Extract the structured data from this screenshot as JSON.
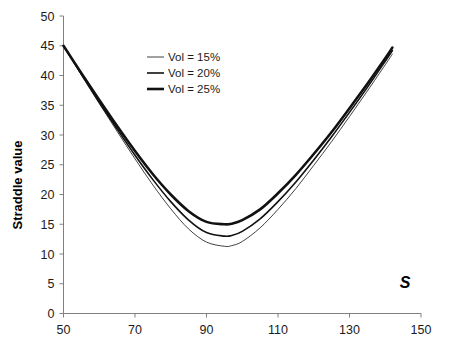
{
  "chart_data": {
    "type": "line",
    "title": "",
    "xlabel": "S",
    "ylabel": "Straddle value",
    "xlim": [
      50,
      150
    ],
    "ylim": [
      0,
      50
    ],
    "xticks": [
      50,
      70,
      90,
      110,
      130,
      150
    ],
    "yticks": [
      0,
      5,
      10,
      15,
      20,
      25,
      30,
      35,
      40,
      45,
      50
    ],
    "grid": false,
    "legend_position": "upper-left-inside",
    "x": [
      50,
      55,
      60,
      65,
      70,
      75,
      80,
      85,
      90,
      95,
      97,
      100,
      105,
      110,
      115,
      120,
      125,
      130,
      135,
      140,
      142
    ],
    "series": [
      {
        "name": "Vol = 15%",
        "label": "Vol = 15%",
        "stroke_width": 0.8,
        "color": "#111111",
        "values": [
          45.0,
          40.1,
          35.3,
          30.6,
          26.0,
          21.6,
          17.6,
          14.2,
          12.0,
          11.3,
          11.4,
          12.1,
          14.4,
          17.5,
          21.0,
          24.9,
          28.9,
          33.1,
          37.4,
          41.8,
          43.6
        ]
      },
      {
        "name": "Vol = 20%",
        "label": "Vol = 20%",
        "stroke_width": 1.6,
        "color": "#111111",
        "values": [
          45.0,
          40.2,
          35.5,
          31.0,
          26.6,
          22.5,
          18.8,
          15.7,
          13.6,
          13.0,
          13.1,
          13.8,
          15.9,
          18.8,
          22.1,
          25.8,
          29.7,
          33.8,
          38.0,
          42.4,
          44.2
        ]
      },
      {
        "name": "Vol = 25%",
        "label": "Vol = 25%",
        "stroke_width": 2.6,
        "color": "#111111",
        "values": [
          45.0,
          40.4,
          35.9,
          31.5,
          27.3,
          23.4,
          20.0,
          17.2,
          15.4,
          15.0,
          15.1,
          15.7,
          17.5,
          20.2,
          23.3,
          26.8,
          30.5,
          34.5,
          38.6,
          42.9,
          44.7
        ]
      }
    ],
    "annotations": [
      {
        "name": "s-axis-label",
        "text": "S",
        "x": 135,
        "y": 5
      }
    ],
    "minima": [
      {
        "series": "Vol = 15%",
        "x": 95,
        "y": 11.3
      },
      {
        "series": "Vol = 20%",
        "x": 95,
        "y": 13.0
      },
      {
        "series": "Vol = 25%",
        "x": 95,
        "y": 15.0
      }
    ]
  },
  "axis": {
    "y_label": "Straddle value",
    "x_label": "S",
    "x_tick_labels": [
      "50",
      "70",
      "90",
      "110",
      "130",
      "150"
    ],
    "y_tick_labels": [
      "0",
      "5",
      "10",
      "15",
      "20",
      "25",
      "30",
      "35",
      "40",
      "45",
      "50"
    ]
  },
  "legend": {
    "items": [
      {
        "label": "Vol = 15%"
      },
      {
        "label": "Vol = 20%"
      },
      {
        "label": "Vol = 25%"
      }
    ]
  }
}
